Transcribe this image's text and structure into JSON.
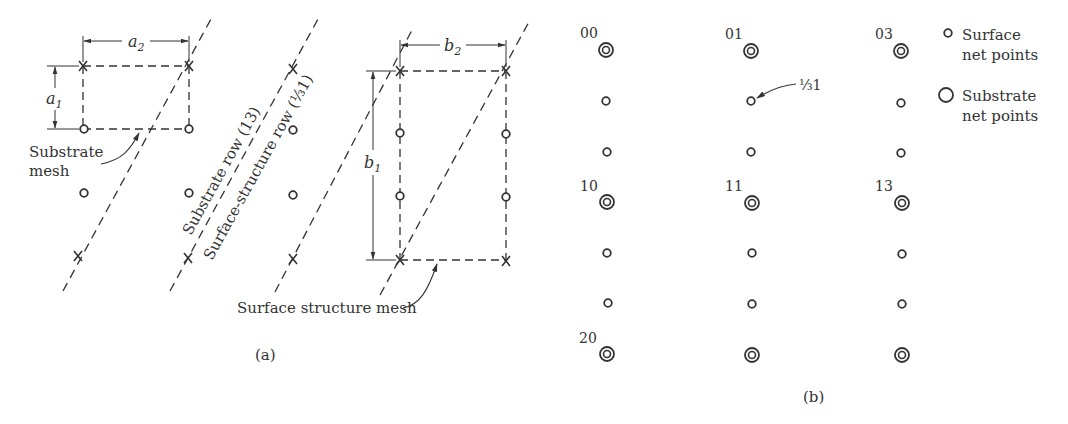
{
  "panel_a": {
    "caption": "(a)",
    "substrate_mesh": {
      "label_line1": "Substrate",
      "label_line2": "mesh",
      "dim_a1": "a",
      "dim_a1_sub": "1",
      "dim_a2": "a",
      "dim_a2_sub": "2"
    },
    "surface_mesh": {
      "label": "Surface structure mesh",
      "dim_b1": "b",
      "dim_b1_sub": "1",
      "dim_b2": "b",
      "dim_b2_sub": "2"
    },
    "row_labels": {
      "substrate_row": "Substrate row (13)",
      "surface_row_prefix": "Surface-structure row (",
      "surface_row_fraction": "⅓",
      "surface_row_suffix": "1)"
    },
    "markers": {
      "cross": "×",
      "circle": "o"
    }
  },
  "panel_b": {
    "caption": "(b)",
    "spot_labels": [
      "00",
      "01",
      "03",
      "10",
      "11",
      "13",
      "20"
    ],
    "annotation_fraction": "⅓",
    "annotation_suffix": "1",
    "legend": [
      {
        "symbol": "small-circle",
        "line1": "Surface",
        "line2": "net points"
      },
      {
        "symbol": "large-circle",
        "line1": "Substrate",
        "line2": "net points"
      }
    ]
  },
  "colors": {
    "ink": "#333333",
    "background": "#ffffff"
  }
}
